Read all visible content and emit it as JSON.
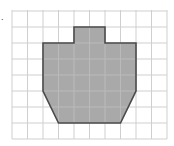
{
  "figure": {
    "label": ".",
    "grid": {
      "origin_x": 12,
      "origin_y": 11,
      "cell_w": 15.5,
      "cell_h": 16,
      "cols": 10,
      "rows": 8,
      "line_color": "#cfcfcf"
    },
    "shape": {
      "description": "Shaded polygon on a square grid",
      "fill": "#a9a9a9",
      "stroke": "#4a4a4a",
      "vertices_grid": [
        [
          4,
          1
        ],
        [
          6,
          1
        ],
        [
          6,
          2
        ],
        [
          8,
          2
        ],
        [
          8,
          5
        ],
        [
          7,
          7
        ],
        [
          3,
          7
        ],
        [
          2,
          5
        ],
        [
          2,
          2
        ],
        [
          4,
          2
        ]
      ]
    }
  }
}
